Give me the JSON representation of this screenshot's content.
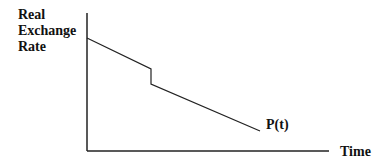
{
  "diagram": {
    "y_axis_label": [
      "Real",
      "Exchange",
      "Rate"
    ],
    "x_axis_label": "Time",
    "curve_label": "P(t)",
    "curve": {
      "segments": [
        {
          "from": [
            87,
            38
          ],
          "to": [
            151,
            69
          ],
          "desc": "declining path"
        },
        {
          "from": [
            151,
            69
          ],
          "to": [
            151,
            84
          ],
          "desc": "discrete jump down"
        },
        {
          "from": [
            151,
            84
          ],
          "to": [
            260,
            131
          ],
          "desc": "declining path"
        }
      ]
    },
    "colors": {
      "line": "#222222",
      "text": "#111111"
    }
  }
}
